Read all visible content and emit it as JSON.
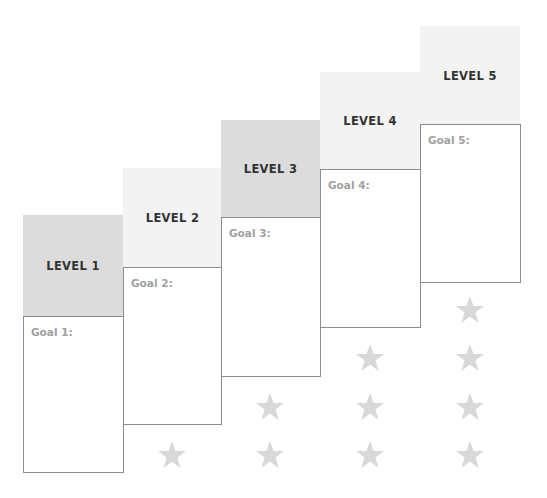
{
  "diagram": {
    "type": "staircase-levels",
    "colors": {
      "header_dark": "#dcdcdc",
      "header_light": "#f3f3f3",
      "star": "#d8d8d8",
      "border": "#8c8c8c",
      "goal_text": "#a0a0a0"
    },
    "levels": [
      {
        "label": "LEVEL 1",
        "goal": "Goal 1:",
        "stars": 0
      },
      {
        "label": "LEVEL 2",
        "goal": "Goal 2:",
        "stars": 1
      },
      {
        "label": "LEVEL 3",
        "goal": "Goal 3:",
        "stars": 2
      },
      {
        "label": "LEVEL 4",
        "goal": "Goal 4:",
        "stars": 3
      },
      {
        "label": "LEVEL 5",
        "goal": "Goal 5:",
        "stars": 4
      }
    ],
    "star_icon": "star-icon"
  }
}
